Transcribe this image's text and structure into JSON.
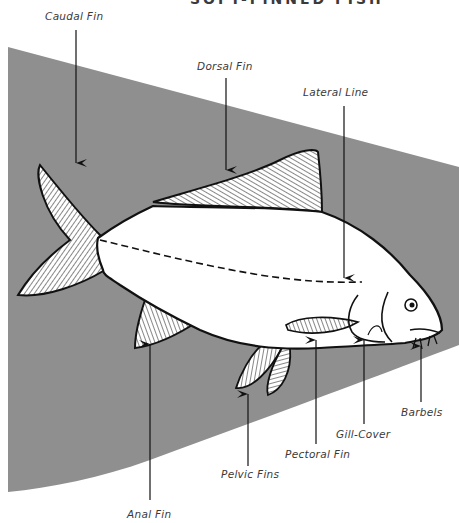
{
  "title": "SOFT-FINNED FISH",
  "colors": {
    "background_band": "#8f8f8f",
    "fish_body": "#ffffff",
    "outline": "#111111",
    "label_text": "#3a3a3a"
  },
  "labels": {
    "caudal_fin": "Caudal Fin",
    "dorsal_fin": "Dorsal Fin",
    "lateral_line": "Lateral Line",
    "anal_fin": "Anal Fin",
    "pelvic_fins": "Pelvic Fins",
    "pectoral_fin": "Pectoral Fin",
    "gill_cover": "Gill-Cover",
    "barbels": "Barbels"
  }
}
